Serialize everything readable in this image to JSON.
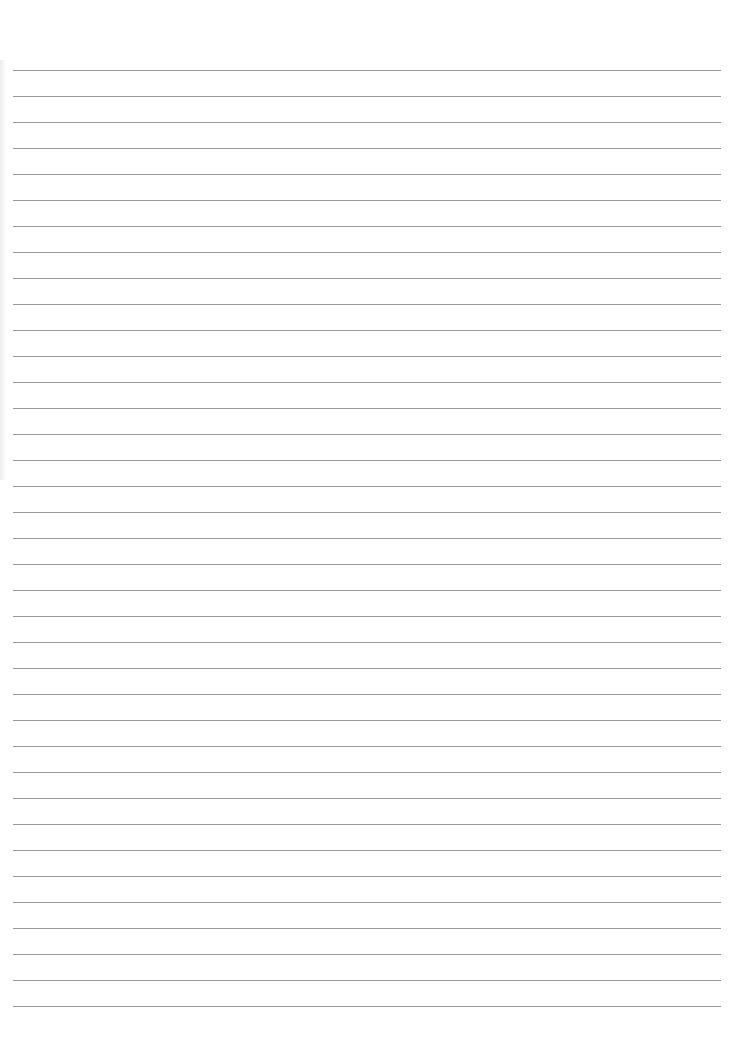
{
  "document": {
    "type": "lined-paper",
    "text": "",
    "line_count": 37,
    "line_start_y": 70,
    "line_spacing": 26,
    "line_left": 13,
    "line_right": 721,
    "colors": {
      "paper": "#ffffff",
      "rule": "#9a9a9a"
    }
  }
}
